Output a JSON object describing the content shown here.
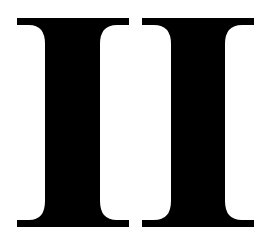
{
  "text": "II",
  "glyphs": [
    {
      "char": "I"
    },
    {
      "char": "I"
    }
  ],
  "colors": {
    "glyph": "#000000",
    "background": "#ffffff"
  }
}
